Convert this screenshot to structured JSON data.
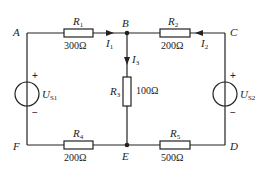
{
  "diagram": {
    "type": "circuit",
    "nodes": [
      {
        "id": "A",
        "label": "A"
      },
      {
        "id": "B",
        "label": "B"
      },
      {
        "id": "C",
        "label": "C"
      },
      {
        "id": "D",
        "label": "D"
      },
      {
        "id": "E",
        "label": "E"
      },
      {
        "id": "F",
        "label": "F"
      }
    ],
    "resistors": [
      {
        "name": "R",
        "sub": "1",
        "value": "300Ω",
        "between": "A-B"
      },
      {
        "name": "R",
        "sub": "2",
        "value": "200Ω",
        "between": "B-C"
      },
      {
        "name": "R",
        "sub": "3",
        "value": "100Ω",
        "between": "B-E"
      },
      {
        "name": "R",
        "sub": "4",
        "value": "200Ω",
        "between": "F-E"
      },
      {
        "name": "R",
        "sub": "5",
        "value": "500Ω",
        "between": "E-D"
      }
    ],
    "sources": [
      {
        "name": "U",
        "sub": "S1",
        "plus": "+",
        "minus": "−",
        "between": "A-F"
      },
      {
        "name": "U",
        "sub": "S2",
        "plus": "+",
        "minus": "−",
        "between": "C-D"
      }
    ],
    "currents": [
      {
        "name": "I",
        "sub": "1",
        "direction": "A→B"
      },
      {
        "name": "I",
        "sub": "2",
        "direction": "C→B"
      },
      {
        "name": "I",
        "sub": "3",
        "direction": "B→E"
      }
    ],
    "colors": {
      "wire": "#222222",
      "background": "#ffffff"
    }
  }
}
